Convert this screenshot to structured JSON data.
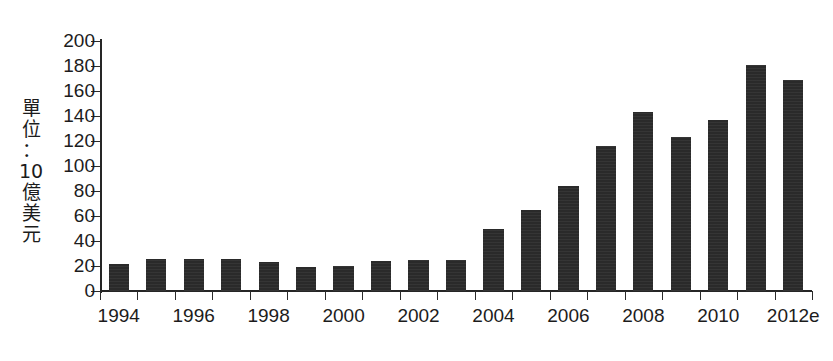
{
  "chart_data": {
    "type": "bar",
    "title": "",
    "subtitle": "",
    "xlabel": "",
    "ylabel": "單位：10億美元",
    "ylabel_chars": [
      "單",
      "位",
      "：",
      "10",
      "億",
      "美",
      "元"
    ],
    "categories": [
      "1994",
      "1995",
      "1996",
      "1997",
      "1998",
      "1999",
      "2000",
      "2001",
      "2002",
      "2003",
      "2004",
      "2005",
      "2006",
      "2007",
      "2008",
      "2009",
      "2010",
      "2011",
      "2012e"
    ],
    "values": [
      22,
      26,
      26,
      26,
      23,
      19,
      20,
      24,
      25,
      25,
      50,
      65,
      84,
      116,
      143,
      123,
      137,
      181,
      169
    ],
    "xtick_labels": [
      "1994",
      "1996",
      "1998",
      "2000",
      "2002",
      "2004",
      "2006",
      "2008",
      "2010",
      "2012e"
    ],
    "xtick_categories": [
      "1994",
      "1996",
      "1998",
      "2000",
      "2002",
      "2004",
      "2006",
      "2008",
      "2010",
      "2012e"
    ],
    "ytick_labels": [
      "200",
      "180",
      "160",
      "140",
      "120",
      "100",
      "80",
      "60",
      "40",
      "20",
      "0"
    ],
    "ytick_values": [
      200,
      180,
      160,
      140,
      120,
      100,
      80,
      60,
      40,
      20,
      0
    ],
    "ylim": [
      0,
      200
    ],
    "ytick_step": 20,
    "grid": false,
    "legend": null,
    "legend_position": "none",
    "bar_color": "#2a2a2a",
    "axis_color": "#262626",
    "background_color": "#ffffff",
    "note": "2012e 為預估值"
  }
}
